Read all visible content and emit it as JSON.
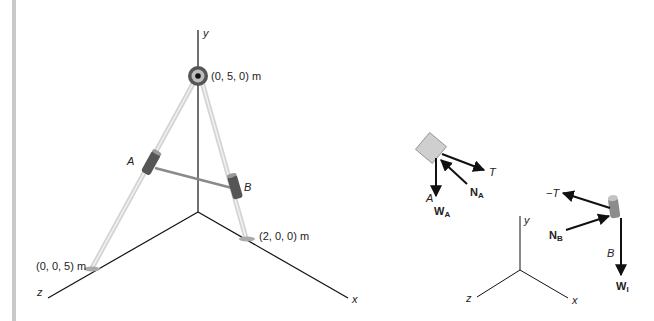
{
  "figure": {
    "main": {
      "axes": {
        "x": "x",
        "y": "y",
        "z": "z"
      },
      "points": {
        "top": "(0, 5, 0) m",
        "z_foot": "(0, 0, 5) m",
        "x_foot": "(2, 0, 0) m"
      },
      "collars": {
        "a": "A",
        "b": "B"
      }
    },
    "fbd_a": {
      "body": "A",
      "forces": {
        "weight_main": "W",
        "weight_sub": "A",
        "normal_main": "N",
        "normal_sub": "A",
        "tension": "T"
      }
    },
    "fbd_b": {
      "body": "B",
      "forces": {
        "weight_main": "W",
        "weight_sub": "l",
        "normal_main": "N",
        "normal_sub": "B",
        "tension": "−T"
      }
    },
    "small_axes": {
      "x": "x",
      "y": "y",
      "z": "z"
    }
  }
}
